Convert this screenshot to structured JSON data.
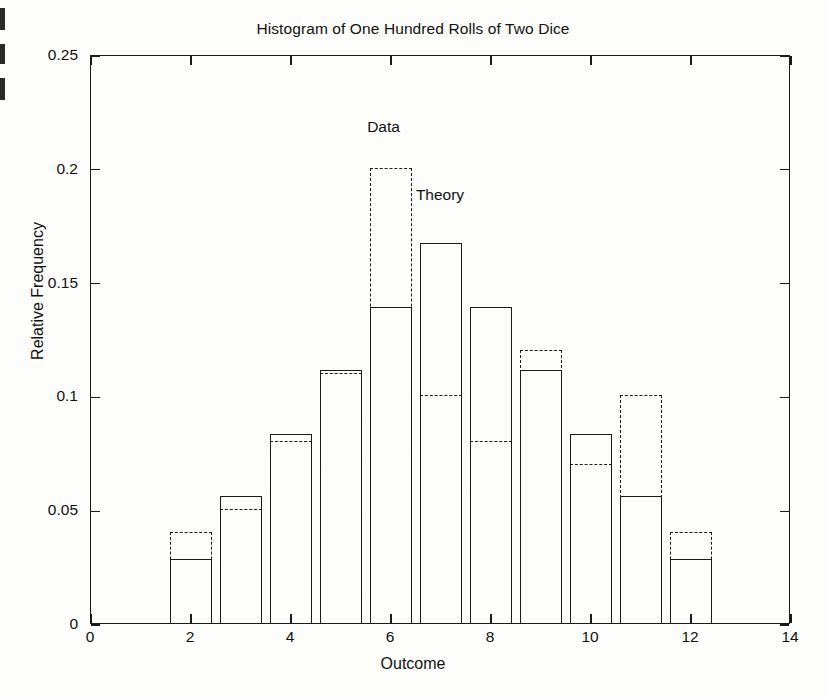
{
  "figure": {
    "title": "Histogram of One Hundred Rolls of Two Dice",
    "x_axis_title": "Outcome",
    "y_axis_title": "Relative Frequency",
    "data_series_label": "Data",
    "theory_series_label": "Theory",
    "line_color": "#1a1a1a",
    "background_color": "#fdfdfb"
  },
  "chart_data": {
    "type": "bar",
    "title": "Histogram of One Hundred Rolls of Two Dice",
    "xlabel": "Outcome",
    "ylabel": "Relative Frequency",
    "xlim": [
      0,
      14
    ],
    "ylim": [
      0,
      0.25
    ],
    "xticks": [
      0,
      2,
      4,
      6,
      8,
      10,
      12,
      14
    ],
    "xticklabels": [
      "0",
      "2",
      "4",
      "6",
      "8",
      "10",
      "12",
      "14"
    ],
    "yticks": [
      0,
      0.05,
      0.1,
      0.15,
      0.2,
      0.25
    ],
    "yticklabels": [
      "0",
      "0.05",
      "0.1",
      "0.15",
      "0.2",
      "0.25"
    ],
    "grid": false,
    "legend": "inline annotations",
    "categories": [
      2,
      3,
      4,
      5,
      6,
      7,
      8,
      9,
      10,
      11,
      12
    ],
    "bar_width": 0.84,
    "series": [
      {
        "name": "Theory",
        "style": "solid outlined bars",
        "annotation": "Theory",
        "annotation_x": 7.0,
        "annotation_y": 0.188,
        "values": [
          0.028,
          0.056,
          0.083,
          0.111,
          0.139,
          0.167,
          0.139,
          0.111,
          0.083,
          0.056,
          0.028
        ]
      },
      {
        "name": "Data",
        "style": "dashed outlined bars",
        "annotation": "Data",
        "annotation_x": 5.87,
        "annotation_y": 0.218,
        "values": [
          0.04,
          0.05,
          0.08,
          0.11,
          0.2,
          0.1,
          0.08,
          0.12,
          0.07,
          0.1,
          0.04
        ]
      }
    ]
  }
}
